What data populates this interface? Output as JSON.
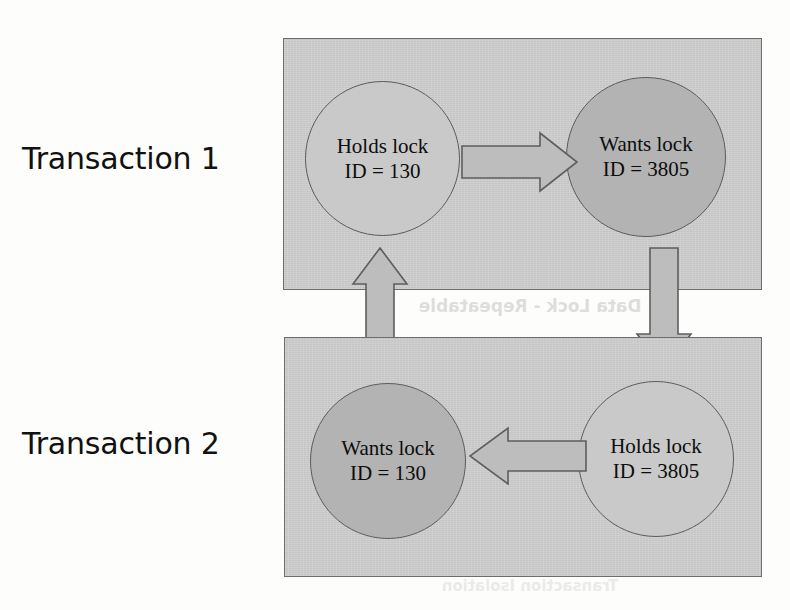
{
  "figure": {
    "background_color": "#fdfdfc",
    "box_fill_color": "#c9c9c9",
    "box_border_color": "#6d6d6d",
    "circle_light_color": "#c9c9c9",
    "circle_dark_color": "#b3b3b3",
    "arrow_fill_color": "#bdbdbd",
    "arrow_border_color": "#5e5e5e"
  },
  "rows": [
    {
      "label": "Transaction 1",
      "nodes": [
        {
          "state": "Holds lock",
          "id_text": "ID = 130",
          "shade": "light"
        },
        {
          "state": "Wants lock",
          "id_text": "ID = 3805",
          "shade": "dark"
        }
      ]
    },
    {
      "label": "Transaction 2",
      "nodes": [
        {
          "state": "Wants lock",
          "id_text": "ID = 130",
          "shade": "dark"
        },
        {
          "state": "Holds lock",
          "id_text": "ID = 3805",
          "shade": "light"
        }
      ]
    }
  ],
  "arrows": [
    {
      "name": "t1-holds-to-t1-wants",
      "direction": "right"
    },
    {
      "name": "t1-wants-to-t2-holds",
      "direction": "down"
    },
    {
      "name": "t2-holds-to-t2-wants",
      "direction": "left"
    },
    {
      "name": "t2-wants-to-t1-holds",
      "direction": "up"
    }
  ],
  "artifacts": {
    "bleed_through_line_1": "Data Lock - Repeatable",
    "bleed_through_line_2": "Transaction Isolation"
  }
}
